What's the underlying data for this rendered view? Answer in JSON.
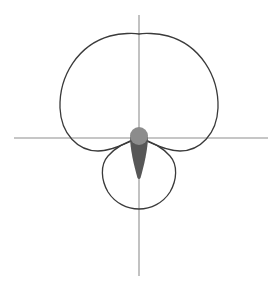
{
  "figure": {
    "name": "polar-lobe-plot",
    "background_color": "#ffffff",
    "width": 278,
    "height": 288,
    "title": "",
    "subtitle": ""
  },
  "axes": {
    "origin_x": 139,
    "origin_y": 138,
    "color": "#b3b3b3",
    "stroke_width": 1.6,
    "horizontal": {
      "label": "horizontal-axis",
      "x_start": 14,
      "x_end": 268,
      "y": 138
    },
    "vertical": {
      "label": "vertical-axis",
      "x": 139,
      "y_start": 15,
      "y_end": 276
    },
    "tick_labels": [],
    "grid": false
  },
  "curves": {
    "stroke_color": "#3a3a3a",
    "stroke_width": 1.3,
    "fill": "none",
    "major_lobe": {
      "name": "major-lobe",
      "apex_y": 34,
      "left_x": 60,
      "right_x": 218,
      "below_axis_dip_y": 152
    },
    "minor_lobe": {
      "name": "minor-lobe",
      "bottom_y": 209,
      "left_x": 101,
      "right_x": 177
    }
  },
  "marker": {
    "name": "origin-teardrop-marker",
    "bulb_color": "#8c8c8c",
    "cone_color": "#575757",
    "bulb_radius": 9,
    "bulb_center_x": 139,
    "bulb_center_y": 136,
    "cone_tip_y": 178,
    "cone_half_width": 8
  },
  "chart_data": {
    "type": "line",
    "title": "",
    "subtitle": "",
    "xlabel": "",
    "ylabel": "",
    "legend": [],
    "legend_position": "none",
    "grid": false,
    "coordinate_system": "polar",
    "annotations": [],
    "xlim": [
      -1.25,
      1.25
    ],
    "ylim": [
      -1.25,
      1.25
    ],
    "series": [
      {
        "name": "major-lobe",
        "description": "Large upper lobe, cardioid-like closed curve through the origin with apex toward +y",
        "theta_deg": [
          0,
          15,
          30,
          45,
          60,
          75,
          90,
          105,
          120,
          135,
          150,
          165,
          180,
          195,
          210,
          225,
          240,
          255,
          270,
          285,
          300,
          315,
          330,
          345,
          360
        ],
        "r": [
          0.62,
          0.75,
          0.88,
          0.99,
          1.06,
          1.09,
          1.1,
          1.09,
          1.06,
          0.99,
          0.88,
          0.75,
          0.62,
          0.47,
          0.33,
          0.2,
          0.1,
          0.03,
          0.0,
          0.03,
          0.1,
          0.2,
          0.33,
          0.47,
          0.62
        ]
      },
      {
        "name": "minor-lobe",
        "description": "Small lower lobe, near-circular closed curve through the origin extending toward -y",
        "theta_deg": [
          0,
          15,
          30,
          45,
          60,
          75,
          90,
          105,
          120,
          135,
          150,
          165,
          180,
          195,
          210,
          225,
          240,
          255,
          270,
          285,
          300,
          315,
          330,
          345,
          360
        ],
        "r": [
          0.0,
          0.03,
          0.09,
          0.16,
          0.24,
          0.3,
          0.34,
          0.36,
          0.36,
          0.34,
          0.3,
          0.24,
          0.18,
          0.24,
          0.3,
          0.34,
          0.36,
          0.36,
          0.34,
          0.3,
          0.24,
          0.16,
          0.09,
          0.03,
          0.0
        ]
      },
      {
        "name": "origin-teardrop-marker",
        "description": "Filled teardrop at the origin: rounded bulb on the axis with a tapering cone pointing downward",
        "theta_deg": [
          90,
          270
        ],
        "r": [
          0.07,
          0.33
        ]
      }
    ]
  }
}
